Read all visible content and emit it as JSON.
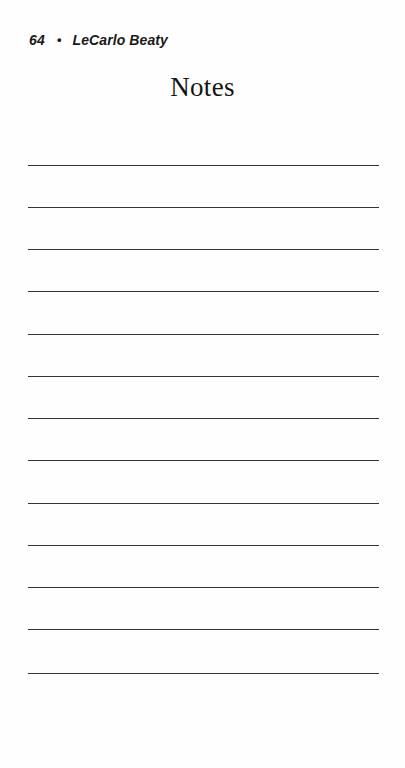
{
  "page": {
    "background_color": "#fefefe",
    "width": 405,
    "height": 768
  },
  "running_head": {
    "folio": "64",
    "separator": "•",
    "author": "LeCarlo Beaty"
  },
  "title": {
    "text": "Notes"
  },
  "ruled_lines": {
    "count": 13,
    "color": "#333333",
    "left": 28,
    "right": 379,
    "thickness": 1,
    "y_positions": [
      165,
      207,
      249,
      291,
      334,
      376,
      418,
      460,
      503,
      545,
      587,
      629,
      673
    ]
  }
}
